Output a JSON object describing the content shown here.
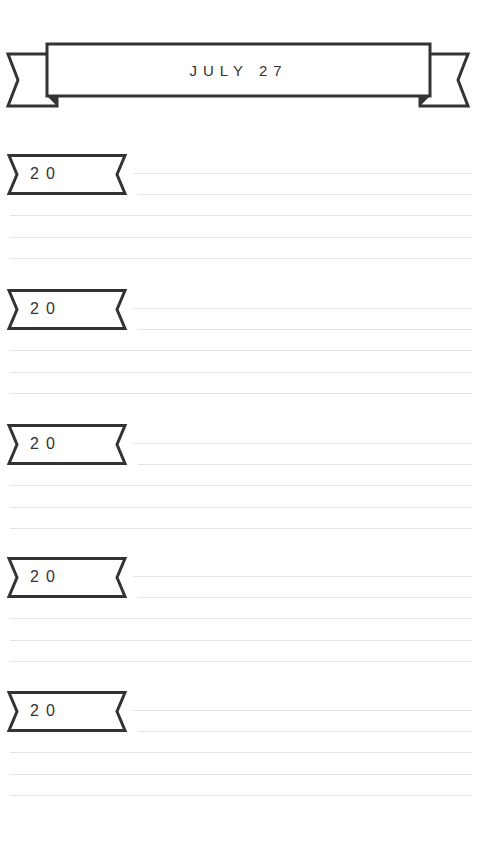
{
  "header": {
    "title": "JULY 27"
  },
  "colors": {
    "ink": "#333333",
    "rule": "#e4e4e4",
    "paper": "#ffffff"
  },
  "sections": [
    {
      "year_label": "20",
      "lines": 5
    },
    {
      "year_label": "20",
      "lines": 5
    },
    {
      "year_label": "20",
      "lines": 5
    },
    {
      "year_label": "20",
      "lines": 5
    },
    {
      "year_label": "20",
      "lines": 5
    }
  ]
}
